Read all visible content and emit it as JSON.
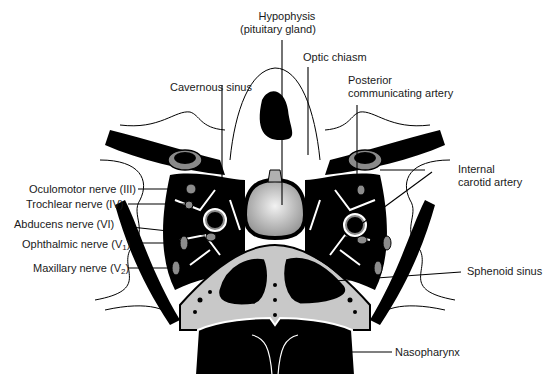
{
  "figure": {
    "colors": {
      "ink": "#000000",
      "bone": "#c8c8c8",
      "vessel_wall": "#8a8a8a",
      "nerve": "#8c8c8c",
      "gland_light": "#e8e8e8",
      "gland_dark": "#9a9a9a",
      "background": "#ffffff"
    },
    "labels": {
      "hypophysis_line1": "Hypophysis",
      "hypophysis_line2": "(pituitary gland)",
      "optic_chiasm": "Optic chiasm",
      "cavernous_sinus": "Cavernous sinus",
      "posterior_comm_line1": "Posterior",
      "posterior_comm_line2": "communicating artery",
      "internal_carotid_line1": "Internal",
      "internal_carotid_line2": "carotid artery",
      "oculomotor": "Oculomotor nerve (III)",
      "trochlear": "Trochlear nerve (IV)",
      "abducens": "Abducens nerve (VI)",
      "ophthalmic": "Ophthalmic nerve (V",
      "ophthalmic_sub": "1",
      "maxillary": "Maxillary nerve (V",
      "maxillary_sub": "2",
      "close_paren": ")",
      "sphenoid_sinus": "Sphenoid sinus",
      "nasopharynx": "Nasopharynx"
    }
  }
}
